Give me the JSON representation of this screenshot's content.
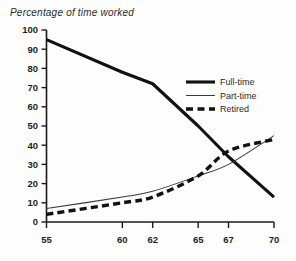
{
  "chart_data": {
    "type": "line",
    "title": "Percentage of time worked",
    "xlabel": "",
    "ylabel": "",
    "xlim": [
      55,
      70
    ],
    "ylim": [
      0,
      100
    ],
    "grid": false,
    "legend_position": "inside-right",
    "x_ticks": [
      55,
      60,
      62,
      65,
      67,
      70
    ],
    "x_tick_labels": [
      "55",
      "60",
      "62",
      "65",
      "67",
      "70"
    ],
    "y_ticks": [
      0,
      10,
      20,
      30,
      40,
      50,
      60,
      70,
      80,
      90,
      100
    ],
    "y_tick_labels": [
      "0",
      "10",
      "20",
      "30",
      "40",
      "50",
      "60",
      "70",
      "80",
      "90",
      "100"
    ],
    "x": [
      55,
      60,
      62,
      65,
      67,
      70
    ],
    "series": [
      {
        "name": "Full-time",
        "style": "thick-solid",
        "color": "#111111",
        "values": [
          95,
          78,
          72,
          50,
          34,
          13
        ]
      },
      {
        "name": "Part-time",
        "style": "thin-solid",
        "color": "#3a3a3a",
        "values": [
          7,
          13,
          16,
          24,
          30,
          45
        ]
      },
      {
        "name": "Retired",
        "style": "thick-dashed",
        "color": "#111111",
        "values": [
          4,
          10,
          13,
          24,
          37,
          43
        ]
      }
    ]
  },
  "legend": {
    "entries": [
      {
        "label": "Full-time"
      },
      {
        "label": "Part-time"
      },
      {
        "label": "Retired"
      }
    ]
  }
}
